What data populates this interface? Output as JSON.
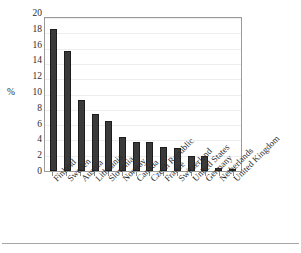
{
  "chart_data": {
    "type": "bar",
    "title": "",
    "subtitle": "",
    "xlabel": "",
    "ylabel": "%",
    "ylim": [
      0,
      20
    ],
    "yticks": [
      20,
      18,
      16,
      14,
      12,
      10,
      8,
      6,
      4,
      2,
      0
    ],
    "grid": true,
    "legend": null,
    "orientation": "vertical",
    "label_rotation": -45,
    "categories": [
      "Finland",
      "Sweden",
      "Austria",
      "Lithuania",
      "Slovenia",
      "Norway",
      "Canada",
      "Czech Republic",
      "France",
      "Switzerland",
      "United States",
      "Germany",
      "Netherlands",
      "United Kingdom"
    ],
    "values": [
      18.5,
      15.7,
      9.3,
      7.5,
      6.5,
      4.4,
      3.85,
      3.75,
      3.2,
      3.0,
      2.0,
      1.9,
      0.45,
      0.15
    ],
    "series": [
      {
        "name": "",
        "values": [
          18.5,
          15.7,
          9.3,
          7.5,
          6.5,
          4.4,
          3.85,
          3.75,
          3.2,
          3.0,
          2.0,
          1.9,
          0.45,
          0.15
        ]
      }
    ],
    "colors": {
      "bar_fill": "#3a3a3a",
      "bar_edge": "#1d1d1d",
      "plot_background": "#ffffff",
      "plot_border": "#9a9a9a",
      "gridline": "#ededed",
      "text": "#2b2b2b",
      "footer_rule": "#a6a6a6"
    }
  }
}
